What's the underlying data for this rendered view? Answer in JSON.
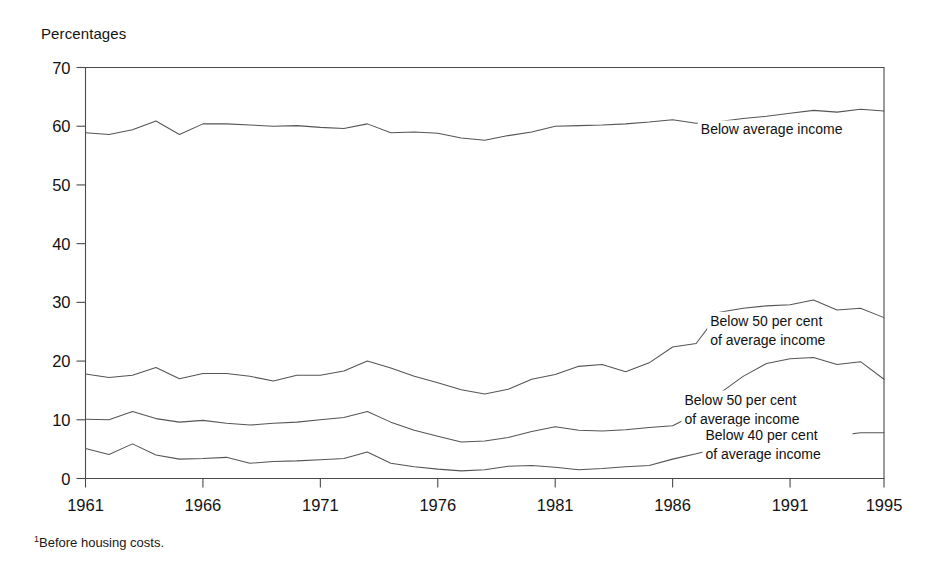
{
  "figure": {
    "axis_title": "Percentages",
    "footnote_marker": "1",
    "footnote_text": "Before housing costs."
  },
  "chart_data": {
    "type": "line",
    "title": "",
    "subtitle": "",
    "xlabel": "",
    "ylabel": "Percentages",
    "xlim": [
      1961,
      1995
    ],
    "ylim": [
      0,
      70
    ],
    "yticks": [
      0,
      10,
      20,
      30,
      40,
      50,
      60,
      70
    ],
    "xticks": [
      1961,
      1966,
      1971,
      1976,
      1981,
      1986,
      1991,
      1995
    ],
    "xtick_labels": [
      "1961",
      "1966",
      "1971",
      "1976",
      "1981",
      "1986",
      "1991",
      "1995"
    ],
    "ytick_labels": [
      "0",
      "10",
      "20",
      "30",
      "40",
      "50",
      "60",
      "70"
    ],
    "grid": false,
    "legend_position": "inline-right",
    "line_color": "#555555",
    "x": [
      1961,
      1962,
      1963,
      1964,
      1965,
      1966,
      1967,
      1968,
      1969,
      1970,
      1971,
      1972,
      1973,
      1974,
      1975,
      1976,
      1977,
      1978,
      1979,
      1980,
      1981,
      1982,
      1983,
      1984,
      1985,
      1986,
      1987,
      1988,
      1989,
      1990,
      1991,
      1992,
      1993,
      1994,
      1995
    ],
    "series": [
      {
        "name": "Below average income",
        "label": "Below average income",
        "label_x": 1987.2,
        "label_y": 58.6,
        "values": [
          58.9,
          58.6,
          59.4,
          60.9,
          58.6,
          60.4,
          60.4,
          60.2,
          60.0,
          60.1,
          59.8,
          59.6,
          60.4,
          58.9,
          59.0,
          58.8,
          58.0,
          57.6,
          58.4,
          59.0,
          60.0,
          60.1,
          60.2,
          60.4,
          60.7,
          61.1,
          60.5,
          60.8,
          61.3,
          61.7,
          62.2,
          62.7,
          62.4,
          62.9,
          62.6
        ]
      },
      {
        "name": "Below 50 per cent of average income (upper)",
        "label": "Below 50 per cent\nof average income",
        "label_line1": "Below 50 per cent",
        "label_line2": "of average income",
        "label_x": 1987.6,
        "label_y": 26.0,
        "values": [
          17.8,
          17.2,
          17.6,
          18.9,
          17.0,
          17.9,
          17.9,
          17.4,
          16.6,
          17.6,
          17.6,
          18.3,
          20.0,
          18.8,
          17.4,
          16.3,
          15.1,
          14.4,
          15.2,
          16.9,
          17.7,
          19.1,
          19.4,
          18.2,
          19.7,
          22.4,
          23.0,
          28.3,
          29.0,
          29.4,
          29.6,
          30.4,
          28.7,
          29.0,
          27.4
        ]
      },
      {
        "name": "Below 50 per cent of average income (middle)",
        "label": "Below 50 per cent\nof average income",
        "label_line1": "Below 50 per cent",
        "label_line2": "of average income",
        "label_x": 1986.5,
        "label_y": 12.6,
        "values": [
          10.1,
          10.0,
          11.4,
          10.2,
          9.6,
          9.9,
          9.4,
          9.1,
          9.4,
          9.6,
          10.0,
          10.4,
          11.4,
          9.6,
          8.2,
          7.2,
          6.2,
          6.4,
          7.0,
          8.0,
          8.8,
          8.2,
          8.1,
          8.3,
          8.7,
          9.0,
          11.0,
          14.5,
          17.4,
          19.6,
          20.4,
          20.6,
          19.4,
          19.9,
          16.9
        ]
      },
      {
        "name": "Below 40 per cent of average income",
        "label": "Below 40 per cent\nof average income",
        "label_line1": "Below 40 per cent",
        "label_line2": "of average income",
        "label_x": 1987.4,
        "label_y": 6.5,
        "values": [
          5.1,
          4.1,
          5.9,
          4.0,
          3.3,
          3.4,
          3.6,
          2.6,
          2.9,
          3.0,
          3.2,
          3.4,
          4.5,
          2.6,
          2.0,
          1.6,
          1.3,
          1.5,
          2.1,
          2.2,
          1.9,
          1.5,
          1.7,
          2.0,
          2.2,
          3.3,
          4.2,
          5.2,
          6.6,
          7.8,
          8.3,
          8.1,
          7.3,
          7.8,
          7.8
        ]
      }
    ]
  }
}
